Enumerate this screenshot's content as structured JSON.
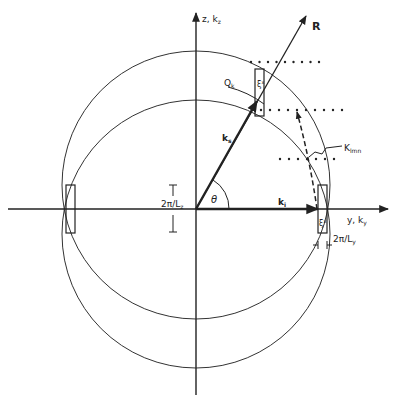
{
  "diagram": {
    "axes": {
      "z_label": "z, k",
      "z_sub": "z",
      "y_label": "y, k",
      "y_sub": "y"
    },
    "vectors": {
      "R_label": "R",
      "ks_label": "k",
      "ks_sub": "s",
      "ki_label": "k",
      "ki_sub": "i",
      "angle_label": "θ"
    },
    "annotations": {
      "Qk_label": "Q",
      "Qk_sub": "k",
      "K_label": "K",
      "K_sub": "lmn",
      "xi_upper": "ξ",
      "xi_upper_sup": "x",
      "xi_lower": "ξ",
      "xi_lower_sup": "x",
      "Lz_label": "2π/L",
      "Lz_sub": "z",
      "Ly_label": "2π/L",
      "Ly_sub": "y"
    },
    "colors": {
      "ink": "#222222",
      "background": "#ffffff"
    }
  }
}
